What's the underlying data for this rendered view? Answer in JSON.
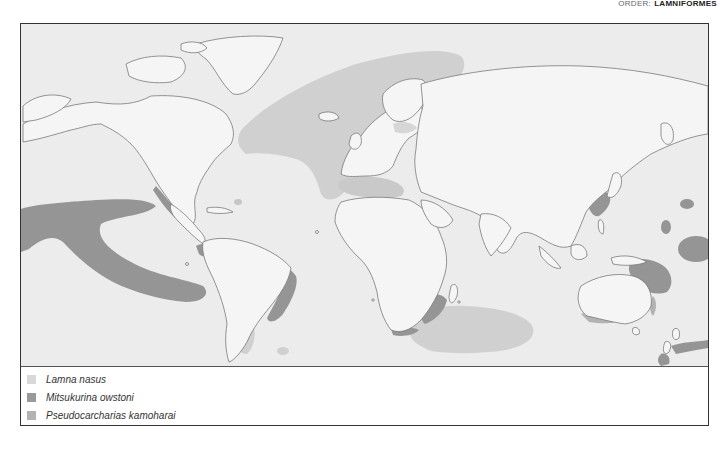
{
  "header": {
    "order_label": "ORDER:",
    "order_name": "LAMNIFORMES"
  },
  "map": {
    "type": "world distribution map",
    "land_color": "#f4f4f4",
    "ocean_color": "#ececec",
    "coastline_color": "#777777",
    "ranges": [
      {
        "species": "Lamna nasus",
        "color": "#d4d4d4",
        "regions": [
          "North Atlantic",
          "Mediterranean",
          "Southwest Atlantic",
          "Southern Indian Ocean",
          "Southern Australia",
          "New Zealand"
        ]
      },
      {
        "species": "Mitsukurina owstoni",
        "color": "#9a9a9a",
        "regions": [
          "East Pacific",
          "Gulf of Mexico",
          "Atlantic coast of South America",
          "Southern Africa",
          "Japan",
          "Eastern Australia",
          "New Zealand"
        ]
      },
      {
        "species": "Pseudocarcharias kamoharai",
        "color": "#b8b8b8",
        "regions": [
          "Eastern Atlantic",
          "Indian Ocean",
          "Western Pacific"
        ]
      }
    ]
  },
  "legend": {
    "items": [
      {
        "label": "Lamna nasus",
        "color": "#d8d8d8"
      },
      {
        "label": "Mitsukurina owstoni",
        "color": "#9a9a9a"
      },
      {
        "label": "Pseudocarcharias kamoharai",
        "color": "#b3b3b3"
      }
    ]
  }
}
